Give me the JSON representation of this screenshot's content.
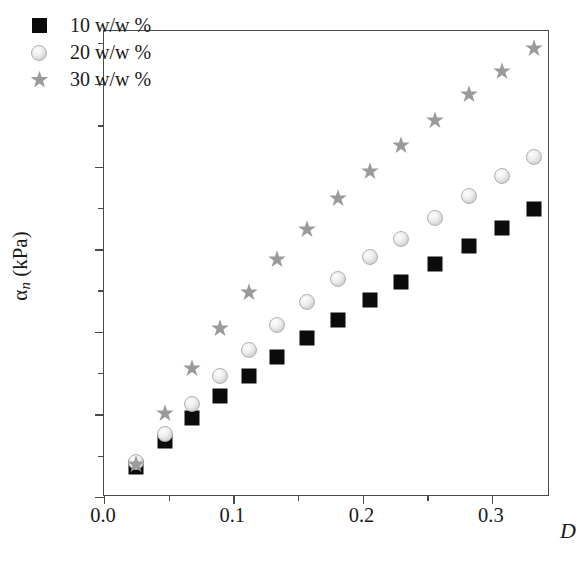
{
  "chart_data": {
    "type": "scatter",
    "title": "",
    "xlabel": "D",
    "ylabel": "αn (kPa)",
    "xlim": [
      0.0,
      0.345
    ],
    "ylim": [
      0.0,
      2.82
    ],
    "grid": false,
    "legend_position": "top-left",
    "x_ticks": [
      "0.0",
      "0.1",
      "0.2",
      "0.3"
    ],
    "x_tick_values": [
      0.0,
      0.1,
      0.2,
      0.3
    ],
    "x_minor_tick_values": [
      0.05,
      0.15,
      0.25,
      0.35
    ],
    "y_ticks": [
      "0.0",
      "0.5",
      "1.0",
      "1.5",
      "2.0",
      "2.5"
    ],
    "y_tick_values": [
      0.0,
      0.5,
      1.0,
      1.5,
      2.0,
      2.5
    ],
    "y_minor_tick_values": [
      0.25,
      0.75,
      1.25,
      1.75,
      2.25,
      2.75
    ],
    "series": [
      {
        "name": "10 w/w %",
        "marker": "filled-square",
        "color": "#0b0b0b",
        "x": [
          0.025,
          0.047,
          0.068,
          0.09,
          0.112,
          0.134,
          0.157,
          0.181,
          0.206,
          0.23,
          0.256,
          0.282,
          0.308,
          0.333
        ],
        "y": [
          0.18,
          0.34,
          0.48,
          0.61,
          0.73,
          0.85,
          0.96,
          1.07,
          1.19,
          1.3,
          1.41,
          1.52,
          1.63,
          1.74
        ]
      },
      {
        "name": "20 w/w %",
        "marker": "shaded-circle",
        "color": "#e2e2e2",
        "x": [
          0.025,
          0.047,
          0.068,
          0.09,
          0.112,
          0.134,
          0.157,
          0.181,
          0.206,
          0.23,
          0.256,
          0.282,
          0.308,
          0.333
        ],
        "y": [
          0.21,
          0.38,
          0.56,
          0.73,
          0.89,
          1.04,
          1.18,
          1.32,
          1.45,
          1.56,
          1.69,
          1.82,
          1.94,
          2.06
        ]
      },
      {
        "name": "30 w/w %",
        "marker": "star",
        "color": "#9a9a9a",
        "x": [
          0.025,
          0.047,
          0.068,
          0.09,
          0.112,
          0.134,
          0.157,
          0.181,
          0.206,
          0.23,
          0.256,
          0.282,
          0.308,
          0.333
        ],
        "y": [
          0.2,
          0.51,
          0.78,
          1.02,
          1.24,
          1.44,
          1.62,
          1.81,
          1.97,
          2.13,
          2.28,
          2.44,
          2.58,
          2.72
        ]
      }
    ]
  }
}
